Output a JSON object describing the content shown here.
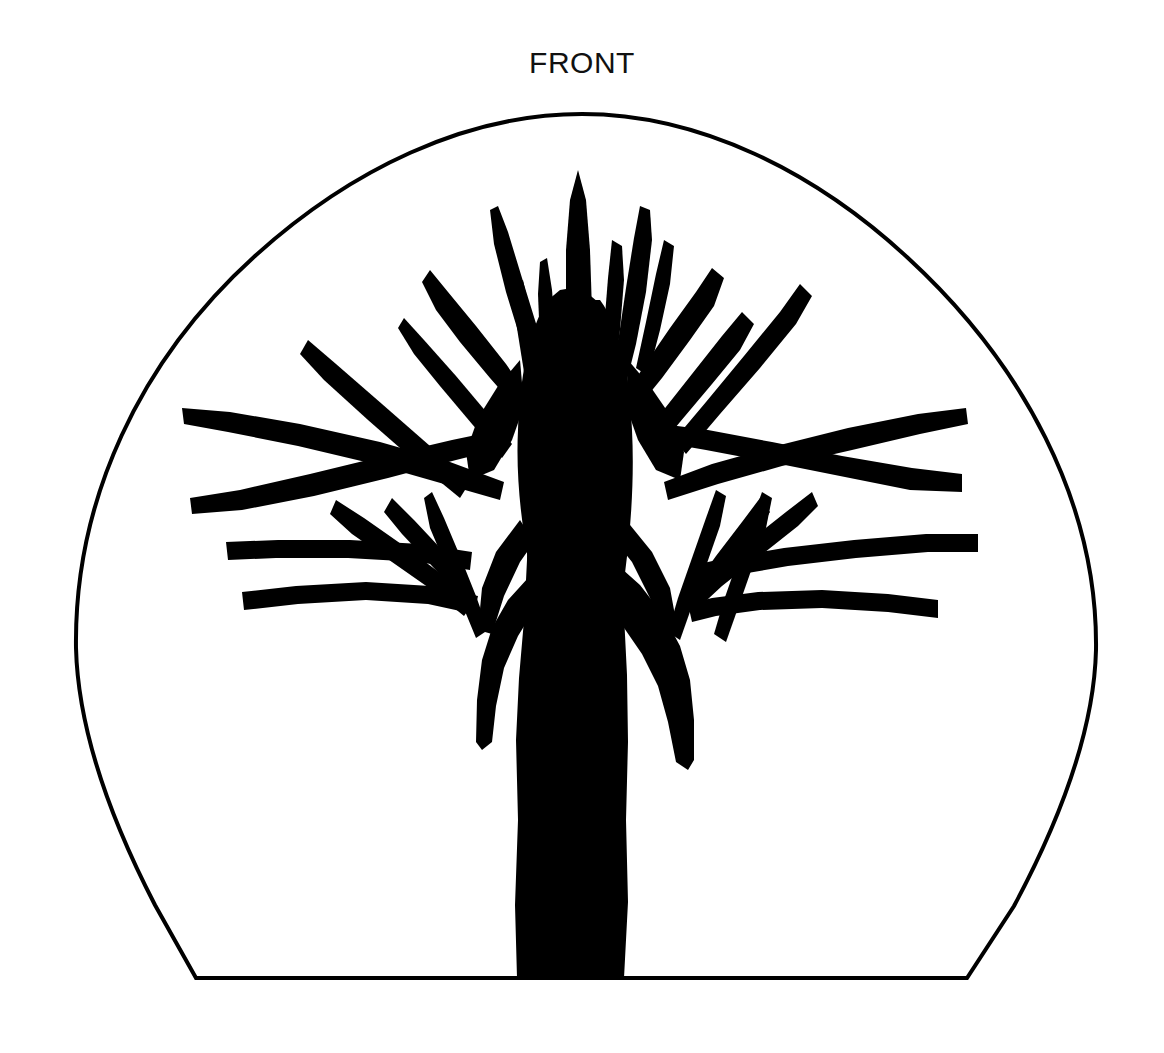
{
  "document": {
    "title": "FRONT",
    "background_color": "#ffffff",
    "ink_color": "#000000",
    "width": 1164,
    "height": 1053
  },
  "caption": {
    "label": "FRONT",
    "align": "center",
    "color": "#111111",
    "font_size_px": 30
  },
  "figure": {
    "name": "bare-tree-silhouette-in-arch",
    "outline": {
      "name": "arch-outline",
      "stroke_color": "#000000",
      "stroke_width_px": 4,
      "fill": "none",
      "apex_x": 582,
      "apex_y": 114,
      "left_extent_x": 76,
      "right_extent_x": 1096,
      "widest_y": 648,
      "baseline_y": 978,
      "baseline_left_x": 196,
      "baseline_right_x": 967
    },
    "tree": {
      "name": "tree-silhouette",
      "fill_color": "#000000",
      "trunk": {
        "base_left_x": 517,
        "base_right_x": 624,
        "base_y": 978,
        "crown_top_y": 170
      },
      "crown": {
        "top_tip_x": 578,
        "top_tip_y": 170,
        "left_tip_x": 182,
        "right_tip_x": 978,
        "branch_count": 34
      }
    }
  }
}
